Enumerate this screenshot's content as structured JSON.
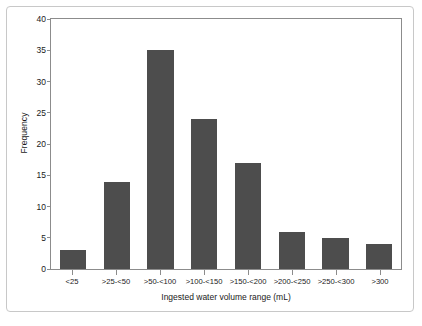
{
  "chart_data": {
    "type": "bar",
    "title": "",
    "xlabel": "Ingested water volume range (mL)",
    "ylabel": "Frequency",
    "categories": [
      "<25",
      ">25-<50",
      ">50-<100",
      ">100-<150",
      ">150-<200",
      ">200-<250",
      ">250-<300",
      ">300"
    ],
    "values": [
      3,
      14,
      35,
      24,
      17,
      6,
      5,
      4
    ],
    "ylim": [
      0,
      40
    ],
    "yticks": [
      0,
      5,
      10,
      15,
      20,
      25,
      30,
      35,
      40
    ],
    "ytick_labels": [
      "0",
      "5",
      "10",
      "15",
      "20",
      "25",
      "30",
      "35",
      "40"
    ],
    "grid": false,
    "legend": false,
    "bar_color": "#4d4d4d",
    "axis_color": "#8c8c8c",
    "frame_color": "#c8c8c8",
    "background": "#ffffff"
  }
}
